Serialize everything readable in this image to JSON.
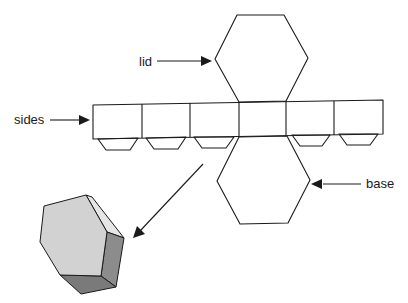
{
  "diagram": {
    "labels": {
      "lid": "lid",
      "sides": "sides",
      "base": "base"
    },
    "parts": [
      {
        "name": "lid",
        "shape": "hexagon"
      },
      {
        "name": "sides",
        "shape": "strip of 6 rectangles",
        "count": 6
      },
      {
        "name": "tabs",
        "shape": "trapezoid",
        "count": 4
      },
      {
        "name": "base",
        "shape": "hexagon"
      },
      {
        "name": "assembled-prism",
        "shape": "3D hexagonal prism"
      }
    ],
    "colors": {
      "line": "#1a1a1a",
      "prism_front": "#d4d4d4",
      "prism_side": "#8a8a8a",
      "prism_bottom": "#7a7a7a",
      "prism_top_edge": "#e8e8e8"
    }
  }
}
